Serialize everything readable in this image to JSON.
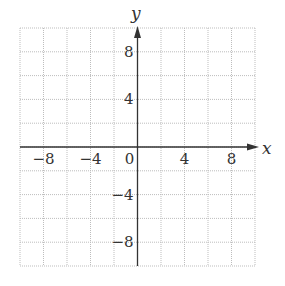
{
  "chart_data": {
    "type": "scatter",
    "title": "",
    "xlabel": "x",
    "ylabel": "y",
    "xlim": [
      -10,
      10
    ],
    "ylim": [
      -10,
      10
    ],
    "grid": true,
    "grid_step": 2,
    "grid_style": "dotted",
    "x_ticks": [
      -8,
      -4,
      0,
      4,
      8
    ],
    "x_tick_labels": [
      "−8",
      "−4",
      "0",
      "4",
      "8"
    ],
    "y_ticks": [
      8,
      4,
      -4,
      -8
    ],
    "y_tick_labels": [
      "8",
      "4",
      "−4",
      "−8"
    ],
    "series": [],
    "legend": null
  },
  "colors": {
    "axis": "#333333",
    "grid": "#bdbdbd",
    "background": "#ffffff"
  }
}
